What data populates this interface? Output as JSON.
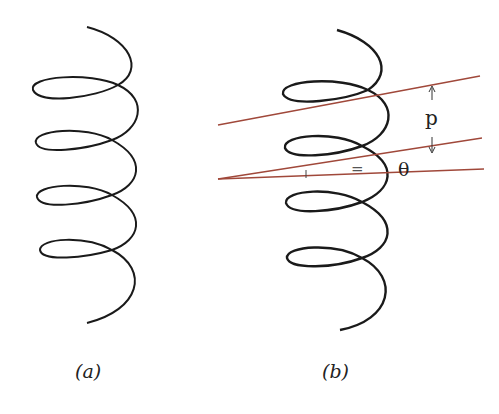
{
  "figure": {
    "panels": [
      {
        "id": "a",
        "caption": "(a)",
        "description": "Helix with four turns"
      },
      {
        "id": "b",
        "caption": "(b)",
        "description": "Helix with pitch and pitch angle construction lines"
      }
    ],
    "annotations": {
      "pitch_label": "p",
      "angle_label": "θ",
      "equal_mark": "="
    },
    "colors": {
      "helix": "#1a1a1a",
      "construction_lines": "#a0483a"
    }
  }
}
